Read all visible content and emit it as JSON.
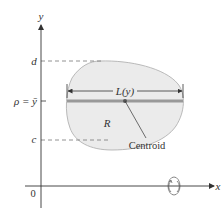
{
  "figure": {
    "axes": {
      "x_label": "x",
      "y_label": "y",
      "origin_label": "0"
    },
    "y_ticks": {
      "d": "d",
      "rho": "ρ = ȳ",
      "c": "c"
    },
    "region": {
      "label": "R",
      "fill": "#ebebeb",
      "stroke": "#aaaaaa"
    },
    "strip": {
      "length_label": "L(y)",
      "bar_color": "#999999"
    },
    "centroid": {
      "label": "Centroid"
    },
    "rotation_axis": {
      "icon": "rotation-about-x-axis-icon"
    },
    "colors": {
      "axis": "#333333",
      "dashed": "#777777"
    }
  }
}
